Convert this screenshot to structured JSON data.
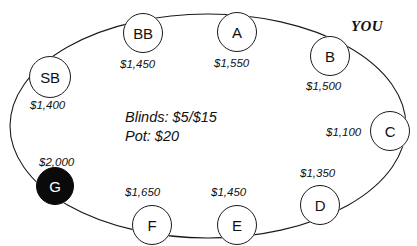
{
  "diagram": {
    "table_shape": "ellipse",
    "center_info": {
      "blinds_line": "Blinds: $5/$15",
      "pot_line": "Pot: $20"
    },
    "hero_marker": {
      "label": "YOU",
      "points_to": "B"
    },
    "seats": [
      {
        "id": "SB",
        "label": "SB",
        "stack": "$1,400",
        "dealer": false,
        "cx": 50,
        "cy": 77,
        "r": 21,
        "stack_x": 30,
        "stack_y": 99
      },
      {
        "id": "BB",
        "label": "BB",
        "stack": "$1,450",
        "dealer": false,
        "cx": 143,
        "cy": 33,
        "r": 20,
        "stack_x": 120,
        "stack_y": 58
      },
      {
        "id": "A",
        "label": "A",
        "stack": "$1,550",
        "dealer": false,
        "cx": 237,
        "cy": 32,
        "r": 20,
        "stack_x": 214,
        "stack_y": 57
      },
      {
        "id": "B",
        "label": "B",
        "stack": "$1,500",
        "dealer": false,
        "cx": 330,
        "cy": 56,
        "r": 20,
        "stack_x": 306,
        "stack_y": 80
      },
      {
        "id": "C",
        "label": "C",
        "stack": "$1,100",
        "dealer": false,
        "cx": 390,
        "cy": 131,
        "r": 20,
        "stack_x": 326,
        "stack_y": 126
      },
      {
        "id": "D",
        "label": "D",
        "stack": "$1,350",
        "dealer": false,
        "cx": 320,
        "cy": 205,
        "r": 20,
        "stack_x": 300,
        "stack_y": 167
      },
      {
        "id": "E",
        "label": "E",
        "stack": "$1,450",
        "dealer": false,
        "cx": 237,
        "cy": 225,
        "r": 20,
        "stack_x": 211,
        "stack_y": 186
      },
      {
        "id": "F",
        "label": "F",
        "stack": "$1,650",
        "dealer": false,
        "cx": 152,
        "cy": 225,
        "r": 20,
        "stack_x": 125,
        "stack_y": 186
      },
      {
        "id": "G",
        "label": "G",
        "stack": "$2,000",
        "dealer": true,
        "cx": 55,
        "cy": 186,
        "r": 19,
        "stack_x": 39,
        "stack_y": 156
      }
    ],
    "colors": {
      "stroke": "#1a1a1a",
      "seat_fill": "#ffffff",
      "dealer_fill": "#0a0a0a",
      "dealer_text": "#ffffff",
      "text": "#111111",
      "background": "#ffffff"
    }
  }
}
